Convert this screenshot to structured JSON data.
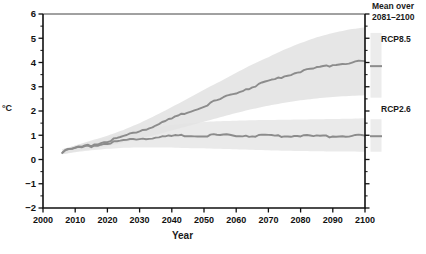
{
  "chart_data": {
    "type": "line",
    "title": "",
    "xlabel": "Year",
    "ylabel": "°C",
    "xlim": [
      2000,
      2100
    ],
    "ylim": [
      -2,
      6
    ],
    "xticks": [
      2000,
      2010,
      2020,
      2030,
      2040,
      2050,
      2060,
      2070,
      2080,
      2090,
      2100
    ],
    "yticks": [
      -2,
      -1,
      0,
      1,
      2,
      3,
      4,
      5,
      6
    ],
    "grid": false,
    "legend_position": "right",
    "legend_title": "Mean over\n2081–2100",
    "series": [
      {
        "name": "RCP8.5",
        "color": "#8c8c8c",
        "band_color": "#e3e3e3",
        "x": [
          2006,
          2010,
          2015,
          2020,
          2025,
          2030,
          2035,
          2040,
          2045,
          2050,
          2055,
          2060,
          2065,
          2070,
          2075,
          2080,
          2085,
          2090,
          2095,
          2100
        ],
        "values": [
          0.32,
          0.45,
          0.6,
          0.76,
          0.95,
          1.18,
          1.42,
          1.68,
          1.95,
          2.22,
          2.48,
          2.75,
          3.0,
          3.22,
          3.44,
          3.62,
          3.78,
          3.9,
          3.98,
          4.05
        ],
        "band_low": [
          0.22,
          0.32,
          0.44,
          0.56,
          0.7,
          0.86,
          1.02,
          1.2,
          1.38,
          1.56,
          1.74,
          1.92,
          2.08,
          2.22,
          2.34,
          2.44,
          2.52,
          2.58,
          2.62,
          2.65
        ],
        "band_high": [
          0.42,
          0.58,
          0.78,
          0.98,
          1.22,
          1.5,
          1.82,
          2.16,
          2.52,
          2.88,
          3.22,
          3.58,
          3.92,
          4.22,
          4.54,
          4.8,
          5.04,
          5.22,
          5.36,
          5.45
        ],
        "mean_2081_2100": 3.85,
        "mean_range_2081_2100": [
          2.55,
          5.22
        ]
      },
      {
        "name": "RCP2.6",
        "color": "#8c8c8c",
        "band_color": "#e8e8e8",
        "x": [
          2006,
          2010,
          2015,
          2020,
          2025,
          2030,
          2035,
          2040,
          2045,
          2050,
          2055,
          2060,
          2065,
          2070,
          2075,
          2080,
          2085,
          2090,
          2095,
          2100
        ],
        "values": [
          0.32,
          0.44,
          0.56,
          0.68,
          0.78,
          0.86,
          0.92,
          0.96,
          0.98,
          1.0,
          1.0,
          0.99,
          0.98,
          0.98,
          0.97,
          0.97,
          0.96,
          0.96,
          0.97,
          0.98
        ],
        "band_low": [
          0.22,
          0.3,
          0.38,
          0.44,
          0.48,
          0.5,
          0.5,
          0.49,
          0.47,
          0.46,
          0.44,
          0.42,
          0.4,
          0.38,
          0.36,
          0.35,
          0.34,
          0.33,
          0.33,
          0.32
        ],
        "band_high": [
          0.42,
          0.58,
          0.74,
          0.92,
          1.08,
          1.22,
          1.34,
          1.43,
          1.5,
          1.55,
          1.58,
          1.6,
          1.62,
          1.63,
          1.64,
          1.65,
          1.66,
          1.67,
          1.68,
          1.7
        ],
        "mean_2081_2100": 0.96,
        "mean_range_2081_2100": [
          0.32,
          1.66
        ]
      }
    ],
    "legend_entries": [
      {
        "label": "RCP8.5",
        "bar_range": [
          2.55,
          5.22
        ],
        "mean_marker": 3.85
      },
      {
        "label": "RCP2.6",
        "bar_range": [
          0.32,
          1.66
        ],
        "mean_marker": 0.96
      }
    ]
  },
  "axis": {
    "ylabel": "°C",
    "xlabel": "Year",
    "xtick_labels": [
      "2000",
      "2010",
      "2020",
      "2030",
      "2040",
      "2050",
      "2060",
      "2070",
      "2080",
      "2090",
      "2100"
    ],
    "ytick_labels": [
      "6",
      "5",
      "4",
      "3",
      "2",
      "1",
      "0",
      "−1",
      "−2"
    ]
  },
  "legend": {
    "title_line1": "Mean over",
    "title_line2": "2081–2100",
    "items": [
      {
        "label": "RCP8.5"
      },
      {
        "label": "RCP2.6"
      }
    ]
  }
}
